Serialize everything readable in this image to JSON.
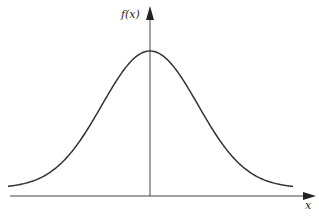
{
  "chart_data": {
    "type": "line",
    "title": "",
    "xlabel": "x",
    "ylabel": "f(x)",
    "series": [
      {
        "name": "f(x)",
        "shape": "gaussian",
        "x": [
          -3,
          -2.5,
          -2,
          -1.5,
          -1,
          -0.5,
          0,
          0.5,
          1,
          1.5,
          2,
          2.5,
          3
        ],
        "values": [
          0.004,
          0.018,
          0.054,
          0.13,
          0.242,
          0.352,
          0.399,
          0.352,
          0.242,
          0.13,
          0.054,
          0.018,
          0.004
        ]
      }
    ],
    "grid": false,
    "legend": "none",
    "axes": {
      "x_arrow": true,
      "y_arrow": true,
      "ticks": false
    }
  },
  "labels": {
    "y_axis": "f(x)",
    "x_axis": "x"
  },
  "colors": {
    "curve": "#333333",
    "axis": "#444444"
  }
}
